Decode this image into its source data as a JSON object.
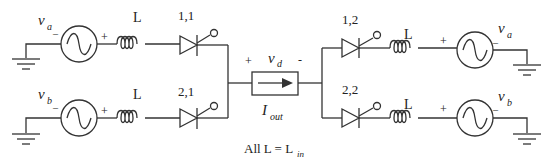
{
  "diagram": {
    "type": "circuit-schematic",
    "sources": {
      "left_a": {
        "label": "v",
        "sub": "a",
        "minus": "_",
        "plus": "+"
      },
      "left_b": {
        "label": "v",
        "sub": "b",
        "minus": "_",
        "plus": "+"
      },
      "right_a": {
        "label": "v",
        "sub": "a",
        "minus": "_",
        "plus": "+"
      },
      "right_b": {
        "label": "v",
        "sub": "b",
        "minus": "_",
        "plus": "+"
      }
    },
    "inductors": {
      "l1": "L",
      "l2": "L",
      "l3": "L",
      "l4": "L"
    },
    "thyristors": {
      "t11": "1,1",
      "t21": "2,1",
      "t12": "1,2",
      "t22": "2,2"
    },
    "load": {
      "voltage_label": "v",
      "voltage_sub": "d",
      "plus": "+",
      "minus": "-",
      "current_label": "I",
      "current_sub": "out"
    },
    "note": {
      "text": "All L = L",
      "sub": "in"
    },
    "colors": {
      "stroke": "#333333",
      "background": "#ffffff"
    }
  }
}
